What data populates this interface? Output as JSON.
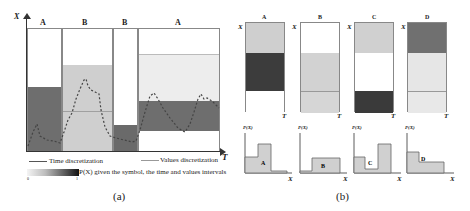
{
  "panel_a": {
    "caption": "(a)",
    "y_axis_label": "X",
    "x_axis_label": "T",
    "segments": [
      {
        "symbol": "A",
        "x0": 27,
        "x1": 62
      },
      {
        "symbol": "B",
        "x0": 62,
        "x1": 113
      },
      {
        "symbol": "B",
        "x0": 113,
        "x1": 138
      },
      {
        "symbol": "A",
        "x0": 138,
        "x1": 220
      }
    ],
    "legend": {
      "time_discretization": "Time discretization",
      "values_discretization": "Values discretization",
      "colorbar_label": "P(X) given the symbol, the time and values intervals",
      "colorbar_min": "0",
      "colorbar_max": "1"
    }
  },
  "panel_b": {
    "caption": "(b)",
    "symbols": [
      {
        "name": "A",
        "bands": [
          "#cfcfcf",
          "#3c3c3c",
          "#ffffff"
        ],
        "pdf_label": "P(X)",
        "x_label": "X",
        "t_label": "T",
        "y_label": "X"
      },
      {
        "name": "B",
        "bands": [
          "#ffffff",
          "#d2d2d2",
          "#d6d6d6"
        ],
        "pdf_label": "P(X)",
        "x_label": "X",
        "t_label": "T",
        "y_label": "X"
      },
      {
        "name": "C",
        "bands": [
          "#d0d0d0",
          "#ffffff",
          "#3a3a3a"
        ],
        "pdf_label": "P(X)",
        "x_label": "X",
        "t_label": "T",
        "y_label": "X"
      },
      {
        "name": "D",
        "bands": [
          "#707070",
          "#e6e6e6",
          "#e8e8e8"
        ],
        "pdf_label": "P(X)",
        "x_label": "X",
        "t_label": "T",
        "y_label": "X"
      }
    ]
  }
}
